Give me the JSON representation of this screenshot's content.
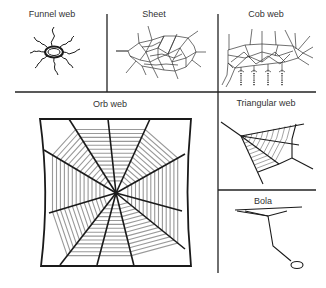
{
  "diagram": {
    "panels": [
      {
        "id": "funnel",
        "label": "Funnel web",
        "label_x": 52,
        "label_y": 13
      },
      {
        "id": "sheet",
        "label": "Sheet",
        "label_x": 154,
        "label_y": 13
      },
      {
        "id": "cob",
        "label": "Cob web",
        "label_x": 266,
        "label_y": 13
      },
      {
        "id": "orb",
        "label": "Orb web",
        "label_x": 110,
        "label_y": 100
      },
      {
        "id": "triangular",
        "label": "Triangular web",
        "label_x": 266,
        "label_y": 99
      },
      {
        "id": "bola",
        "label": "Bola",
        "label_x": 263,
        "label_y": 197
      }
    ],
    "colors": {
      "line": "#1a1a1a",
      "spiral": "#999999",
      "divider": "#222222",
      "text": "#333333"
    }
  }
}
